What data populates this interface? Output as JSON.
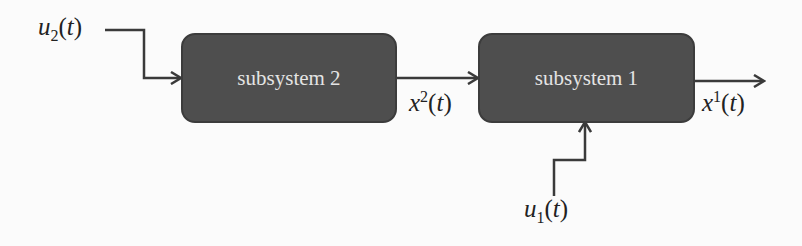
{
  "diagram": {
    "type": "block-diagram",
    "blocks": [
      {
        "id": "subsystem2",
        "label": "subsystem 2"
      },
      {
        "id": "subsystem1",
        "label": "subsystem 1"
      }
    ],
    "signals": {
      "u2": {
        "base": "u",
        "sub": "2",
        "arg": "t"
      },
      "x2": {
        "base": "x",
        "sup": "2",
        "arg": "t"
      },
      "x1": {
        "base": "x",
        "sup": "1",
        "arg": "t"
      },
      "u1": {
        "base": "u",
        "sub": "1",
        "arg": "t"
      }
    },
    "connections": [
      {
        "from": "u2",
        "to": "subsystem2"
      },
      {
        "from": "subsystem2",
        "to": "subsystem1",
        "signal": "x2"
      },
      {
        "from": "subsystem1",
        "to": "output",
        "signal": "x1"
      },
      {
        "from": "u1",
        "to": "subsystem1"
      }
    ],
    "colors": {
      "block_fill": "#4e4e4e",
      "block_text": "#e4e4e4",
      "line": "#3a3a3a",
      "text": "#222222"
    }
  }
}
